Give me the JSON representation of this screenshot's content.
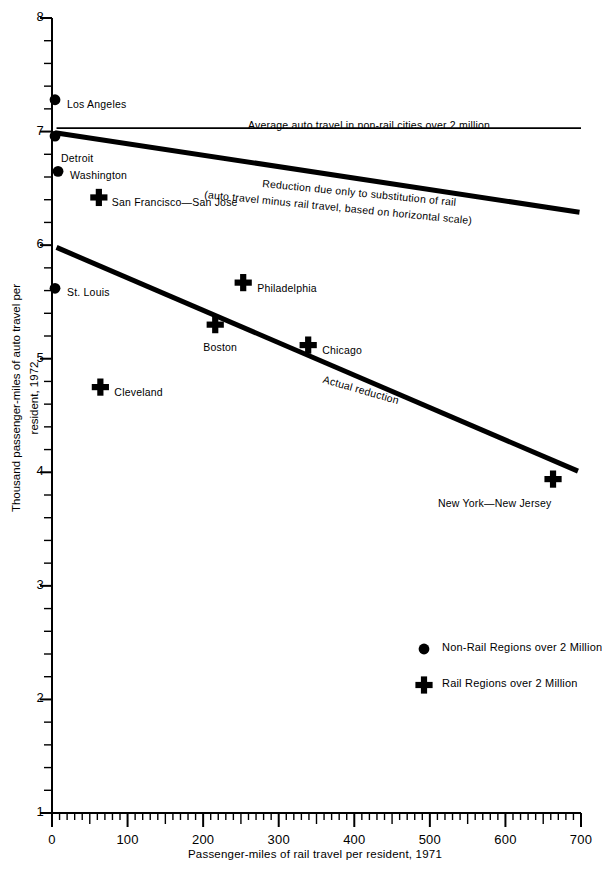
{
  "chart_data": {
    "type": "scatter",
    "title": "",
    "xlabel": "Passenger-miles of rail travel per resident, 1971",
    "ylabel": "Thousand passenger-miles of auto travel per resident, 1972",
    "xlim": [
      0,
      700
    ],
    "ylim": [
      1,
      8
    ],
    "xticks": [
      0,
      100,
      200,
      300,
      400,
      500,
      600,
      700
    ],
    "yticks": [
      1,
      2,
      3,
      4,
      5,
      6,
      7,
      8
    ],
    "x_minor_step": 10,
    "y_minor_step": 0.2,
    "grid": false,
    "legend_position": "inside-lower-right",
    "points": [
      {
        "label": "Los Angeles",
        "x": 4,
        "y": 7.28,
        "marker": "circle",
        "label_dx": 12,
        "label_dy": 4
      },
      {
        "label": "Detroit",
        "x": 4,
        "y": 6.96,
        "marker": "circle",
        "label_dx": 6,
        "label_dy": 22
      },
      {
        "label": "Washington",
        "x": 8,
        "y": 6.65,
        "marker": "circle",
        "label_dx": 12,
        "label_dy": 4
      },
      {
        "label": "San Francisco—San Jose",
        "x": 62,
        "y": 6.42,
        "marker": "plus",
        "label_dx": 13,
        "label_dy": 5
      },
      {
        "label": "St. Louis",
        "x": 4,
        "y": 5.62,
        "marker": "circle",
        "label_dx": 12,
        "label_dy": 4
      },
      {
        "label": "Philadelphia",
        "x": 253,
        "y": 5.67,
        "marker": "plus",
        "label_dx": 14,
        "label_dy": 5
      },
      {
        "label": "Boston",
        "x": 216,
        "y": 5.3,
        "marker": "plus",
        "label_dx": -12,
        "label_dy": 22
      },
      {
        "label": "Chicago",
        "x": 339,
        "y": 5.12,
        "marker": "plus",
        "label_dx": 14,
        "label_dy": 5
      },
      {
        "label": "Cleveland",
        "x": 64,
        "y": 4.75,
        "marker": "plus",
        "label_dx": 14,
        "label_dy": 5
      },
      {
        "label": "New York—New Jersey",
        "x": 663,
        "y": 3.94,
        "marker": "plus",
        "label_dx": -115,
        "label_dy": 24
      }
    ],
    "lines": [
      {
        "name": "average-auto-travel",
        "label": "Average auto travel in non-rail cities over 2 million",
        "style": "thin",
        "from": {
          "x": 6,
          "y": 7.03
        },
        "to": {
          "x": 700,
          "y": 7.03
        },
        "label_x": 248,
        "label_y": 119,
        "label_rotation": 0
      },
      {
        "name": "reduction-substitution",
        "label": "Reduction due only to substitution of rail",
        "label_line2": "(auto travel minus rail travel, based on horizontal scale)",
        "style": "thick",
        "from": {
          "x": 4,
          "y": 6.99
        },
        "to": {
          "x": 698,
          "y": 6.29
        },
        "label_x": 263,
        "label_y": 177,
        "label_rotation": 5.6
      },
      {
        "name": "actual-reduction",
        "label": "Actual reduction",
        "style": "thick",
        "from": {
          "x": 6,
          "y": 5.98
        },
        "to": {
          "x": 696,
          "y": 4.01
        },
        "label_x": 325,
        "label_y": 373,
        "label_rotation": 16
      }
    ],
    "legend": [
      {
        "marker": "circle",
        "label": "Non-Rail Regions over 2 Million"
      },
      {
        "marker": "plus",
        "label": "Rail Regions over 2 Million"
      }
    ],
    "colors": {
      "ink": "#000000",
      "background": "#ffffff"
    }
  }
}
